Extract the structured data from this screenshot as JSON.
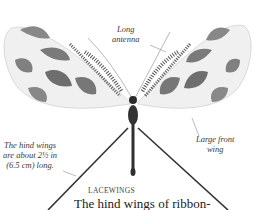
{
  "figure": {
    "labels": {
      "antenna": [
        "Long",
        "antenna"
      ],
      "front_wing": [
        "Large front",
        "wing"
      ],
      "hind_wings": [
        "The hind wings",
        "are about 2½ in",
        "(6.5 cm) long."
      ]
    }
  },
  "article": {
    "heading": "LACEWINGS",
    "body_start": "The hind wings of ribbon-"
  },
  "colors": {
    "wing_pattern": "#7a7a7a",
    "wing_base": "#f2f2f2",
    "body": "#2b2b2b",
    "hind_wing": "#333333"
  }
}
